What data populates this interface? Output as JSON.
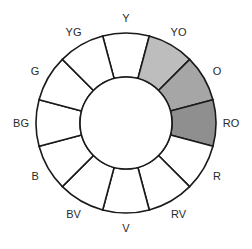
{
  "diagram": {
    "type": "color-wheel",
    "segments": [
      {
        "label": "Y",
        "fill": "#ffffff",
        "highlighted": false
      },
      {
        "label": "YO",
        "fill": "#bdbdbd",
        "highlighted": true
      },
      {
        "label": "O",
        "fill": "#a6a6a6",
        "highlighted": true
      },
      {
        "label": "RO",
        "fill": "#8f8f8f",
        "highlighted": true
      },
      {
        "label": "R",
        "fill": "#ffffff",
        "highlighted": false
      },
      {
        "label": "RV",
        "fill": "#ffffff",
        "highlighted": false
      },
      {
        "label": "V",
        "fill": "#ffffff",
        "highlighted": false
      },
      {
        "label": "BV",
        "fill": "#ffffff",
        "highlighted": false
      },
      {
        "label": "B",
        "fill": "#ffffff",
        "highlighted": false
      },
      {
        "label": "BG",
        "fill": "#ffffff",
        "highlighted": false
      },
      {
        "label": "G",
        "fill": "#ffffff",
        "highlighted": false
      },
      {
        "label": "YG",
        "fill": "#ffffff",
        "highlighted": false
      }
    ],
    "order": "clockwise from top"
  }
}
